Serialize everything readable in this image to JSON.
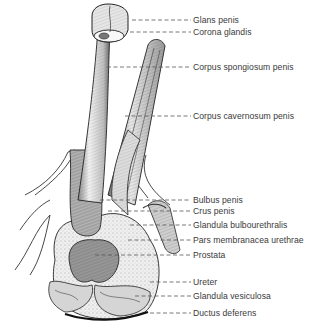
{
  "diagram": {
    "type": "anatomical-illustration",
    "style": "monochrome pen-and-ink engraving",
    "colors": {
      "ink": "#2b2b2b",
      "label_text": "#3a3a3a",
      "leader_line": "#555555",
      "background": "#ffffff"
    },
    "labels": [
      {
        "text": "Glans penis",
        "y": 20,
        "leader_from_x": 132
      },
      {
        "text": "Corona glandis",
        "y": 32,
        "leader_from_x": 130
      },
      {
        "text": "Corpus spongiosum penis",
        "y": 67,
        "leader_from_x": 107
      },
      {
        "text": "Corpus cavernosum penis",
        "y": 116,
        "leader_from_x": 125
      },
      {
        "text": "Bulbus penis",
        "y": 200,
        "leader_from_x": 100
      },
      {
        "text": "Crus penis",
        "y": 211,
        "leader_from_x": 108
      },
      {
        "text": "Glandula bulbourethralis",
        "y": 225,
        "leader_from_x": 130
      },
      {
        "text": "Pars membranacea urethrae",
        "y": 240,
        "leader_from_x": 128
      },
      {
        "text": "Prostata",
        "y": 255,
        "leader_from_x": 95
      },
      {
        "text": "Ureter",
        "y": 282,
        "leader_from_x": 150
      },
      {
        "text": "Glandula vesiculosa",
        "y": 296,
        "leader_from_x": 135
      },
      {
        "text": "Ductus deferens",
        "y": 313,
        "leader_from_x": 150
      }
    ],
    "label_x": 193
  }
}
